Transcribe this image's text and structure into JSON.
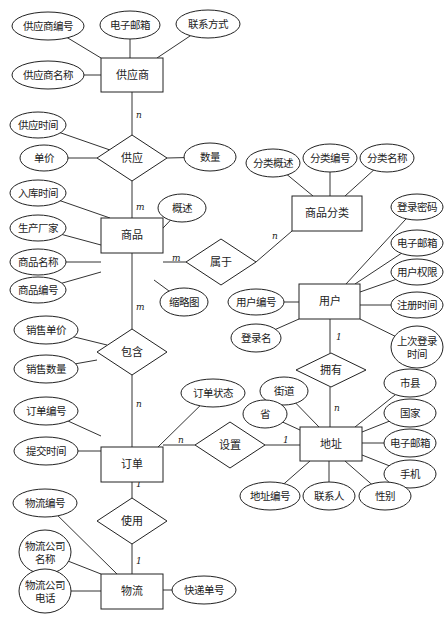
{
  "diagram": {
    "type": "ER diagram",
    "entities": [
      {
        "id": "supplier",
        "label": "供应商",
        "x": 101,
        "y": 58,
        "w": 62,
        "h": 34
      },
      {
        "id": "product",
        "label": "商品",
        "x": 101,
        "y": 218,
        "w": 62,
        "h": 35
      },
      {
        "id": "category",
        "label": "商品分类",
        "x": 292,
        "y": 196,
        "w": 70,
        "h": 35
      },
      {
        "id": "user",
        "label": "用户",
        "x": 299,
        "y": 284,
        "w": 61,
        "h": 35
      },
      {
        "id": "order",
        "label": "订单",
        "x": 101,
        "y": 447,
        "w": 62,
        "h": 35
      },
      {
        "id": "address",
        "label": "地址",
        "x": 300,
        "y": 427,
        "w": 62,
        "h": 34
      },
      {
        "id": "logistics",
        "label": "物流",
        "x": 101,
        "y": 574,
        "w": 62,
        "h": 35
      }
    ],
    "relationships": [
      {
        "id": "supply",
        "label": "供应",
        "cx": 132,
        "cy": 158,
        "hw": 35,
        "hh": 23
      },
      {
        "id": "belongs",
        "label": "属于",
        "cx": 221,
        "cy": 262,
        "hw": 35,
        "hh": 23
      },
      {
        "id": "contain",
        "label": "包含",
        "cx": 132,
        "cy": 352,
        "hw": 35,
        "hh": 23
      },
      {
        "id": "own",
        "label": "拥有",
        "cx": 331,
        "cy": 370,
        "hw": 35,
        "hh": 17
      },
      {
        "id": "setup",
        "label": "设置",
        "cx": 230,
        "cy": 445,
        "hw": 35,
        "hh": 23
      },
      {
        "id": "use",
        "label": "使用",
        "cx": 132,
        "cy": 521,
        "hw": 35,
        "hh": 23
      }
    ],
    "attributes": [
      {
        "label": "供应商编号",
        "cx": 48,
        "cy": 26,
        "rx": 36,
        "ry": 14,
        "to": [
          101,
          58
        ]
      },
      {
        "label": "电子邮箱",
        "cx": 130,
        "cy": 25,
        "rx": 30,
        "ry": 14,
        "to": [
          130,
          58
        ]
      },
      {
        "label": "联系方式",
        "cx": 208,
        "cy": 24,
        "rx": 32,
        "ry": 14,
        "to": [
          157,
          58
        ]
      },
      {
        "label": "供应商名称",
        "cx": 48,
        "cy": 75,
        "rx": 36,
        "ry": 14,
        "to": [
          101,
          75
        ]
      },
      {
        "label": "供应时间",
        "cx": 38,
        "cy": 125,
        "rx": 28,
        "ry": 13,
        "to": [
          110,
          150
        ]
      },
      {
        "label": "单价",
        "cx": 44,
        "cy": 158,
        "rx": 24,
        "ry": 13,
        "to": [
          97,
          158
        ]
      },
      {
        "label": "数量",
        "cx": 210,
        "cy": 157,
        "rx": 26,
        "ry": 14,
        "to": [
          167,
          158
        ]
      },
      {
        "label": "入库时间",
        "cx": 38,
        "cy": 193,
        "rx": 28,
        "ry": 13,
        "to": [
          110,
          218
        ]
      },
      {
        "label": "概述",
        "cx": 182,
        "cy": 208,
        "rx": 24,
        "ry": 14,
        "to": [
          147,
          245
        ]
      },
      {
        "label": "生产厂家",
        "cx": 38,
        "cy": 228,
        "rx": 28,
        "ry": 13,
        "to": [
          101,
          245
        ]
      },
      {
        "label": "商品名称",
        "cx": 38,
        "cy": 262,
        "rx": 28,
        "ry": 13,
        "to": [
          101,
          262
        ]
      },
      {
        "label": "商品编号",
        "cx": 38,
        "cy": 290,
        "rx": 28,
        "ry": 13,
        "to": [
          101,
          272
        ]
      },
      {
        "label": "缩略图",
        "cx": 184,
        "cy": 302,
        "rx": 24,
        "ry": 14,
        "to": [
          154,
          280
        ]
      },
      {
        "label": "分类概述",
        "cx": 273,
        "cy": 163,
        "rx": 27,
        "ry": 14,
        "to": [
          313,
          196
        ]
      },
      {
        "label": "分类编号",
        "cx": 330,
        "cy": 158,
        "rx": 27,
        "ry": 14,
        "to": [
          330,
          196
        ]
      },
      {
        "label": "分类名称",
        "cx": 387,
        "cy": 158,
        "rx": 27,
        "ry": 14,
        "to": [
          345,
          196
        ]
      },
      {
        "label": "登录密码",
        "cx": 417,
        "cy": 207,
        "rx": 26,
        "ry": 13,
        "to": [
          346,
          284
        ]
      },
      {
        "label": "电子邮箱",
        "cx": 417,
        "cy": 243,
        "rx": 26,
        "ry": 13,
        "to": [
          355,
          284
        ]
      },
      {
        "label": "用户权限",
        "cx": 417,
        "cy": 272,
        "rx": 26,
        "ry": 13,
        "to": [
          360,
          292
        ]
      },
      {
        "label": "用户编号",
        "cx": 256,
        "cy": 302,
        "rx": 28,
        "ry": 13,
        "to": [
          299,
          302
        ]
      },
      {
        "label": "注册时间",
        "cx": 417,
        "cy": 305,
        "rx": 26,
        "ry": 13,
        "to": [
          360,
          305
        ]
      },
      {
        "label": "登录名",
        "cx": 256,
        "cy": 338,
        "rx": 25,
        "ry": 14,
        "to": [
          299,
          319
        ]
      },
      {
        "label": "上次登录\n时间",
        "cx": 417,
        "cy": 347,
        "rx": 26,
        "ry": 21,
        "to": [
          360,
          319
        ]
      },
      {
        "label": "销售单价",
        "cx": 46,
        "cy": 330,
        "rx": 32,
        "ry": 14,
        "to": [
          107,
          345
        ]
      },
      {
        "label": "销售数量",
        "cx": 46,
        "cy": 369,
        "rx": 32,
        "ry": 14,
        "to": [
          97,
          360
        ]
      },
      {
        "label": "订单状态",
        "cx": 213,
        "cy": 393,
        "rx": 32,
        "ry": 14,
        "to": [
          158,
          447
        ]
      },
      {
        "label": "街道",
        "cx": 284,
        "cy": 391,
        "rx": 24,
        "ry": 14,
        "to": [
          319,
          427
        ]
      },
      {
        "label": "市县",
        "cx": 410,
        "cy": 383,
        "rx": 26,
        "ry": 14,
        "to": [
          355,
          427
        ]
      },
      {
        "label": "省",
        "cx": 265,
        "cy": 414,
        "rx": 22,
        "ry": 14,
        "to": [
          300,
          430
        ]
      },
      {
        "label": "订单编号",
        "cx": 46,
        "cy": 411,
        "rx": 32,
        "ry": 14,
        "to": [
          101,
          436
        ]
      },
      {
        "label": "国家",
        "cx": 410,
        "cy": 413,
        "rx": 26,
        "ry": 14,
        "to": [
          362,
          432
        ]
      },
      {
        "label": "电子邮箱",
        "cx": 410,
        "cy": 443,
        "rx": 26,
        "ry": 14,
        "to": [
          362,
          443
        ]
      },
      {
        "label": "提交时间",
        "cx": 46,
        "cy": 451,
        "rx": 32,
        "ry": 14,
        "to": [
          101,
          451
        ]
      },
      {
        "label": "手机",
        "cx": 410,
        "cy": 474,
        "rx": 26,
        "ry": 14,
        "to": [
          362,
          455
        ]
      },
      {
        "label": "地址编号",
        "cx": 270,
        "cy": 496,
        "rx": 30,
        "ry": 14,
        "to": [
          310,
          461
        ]
      },
      {
        "label": "联系人",
        "cx": 329,
        "cy": 496,
        "rx": 26,
        "ry": 14,
        "to": [
          329,
          461
        ]
      },
      {
        "label": "性别",
        "cx": 385,
        "cy": 496,
        "rx": 26,
        "ry": 14,
        "to": [
          345,
          461
        ]
      },
      {
        "label": "物流编号",
        "cx": 45,
        "cy": 503,
        "rx": 32,
        "ry": 14,
        "to": [
          117,
          574
        ]
      },
      {
        "label": "物流公司\n名称",
        "cx": 45,
        "cy": 552,
        "rx": 26,
        "ry": 22,
        "to": [
          101,
          574
        ]
      },
      {
        "label": "物流公司\n电话",
        "cx": 45,
        "cy": 591,
        "rx": 26,
        "ry": 22,
        "to": [
          101,
          591
        ]
      },
      {
        "label": "快递单号",
        "cx": 204,
        "cy": 590,
        "rx": 32,
        "ry": 14,
        "to": [
          163,
          590
        ]
      }
    ],
    "links": [
      {
        "from": [
          132,
          92
        ],
        "to": [
          132,
          135
        ],
        "card": "n",
        "cx": 136,
        "cy": 115
      },
      {
        "from": [
          132,
          181
        ],
        "to": [
          132,
          218
        ],
        "card": "m",
        "cx": 136,
        "cy": 207
      },
      {
        "from": [
          163,
          262
        ],
        "to": [
          186,
          262
        ],
        "card": "m",
        "cx": 172,
        "cy": 258
      },
      {
        "from": [
          256,
          262
        ],
        "to": [
          292,
          231
        ],
        "card": "n",
        "cx": 272,
        "cy": 236
      },
      {
        "from": [
          132,
          253
        ],
        "to": [
          132,
          329
        ],
        "card": "m",
        "cx": 136,
        "cy": 307
      },
      {
        "from": [
          132,
          375
        ],
        "to": [
          132,
          447
        ],
        "card": "n",
        "cx": 136,
        "cy": 404
      },
      {
        "from": [
          330,
          319
        ],
        "to": [
          330,
          353
        ],
        "card": "1",
        "cx": 336,
        "cy": 337
      },
      {
        "from": [
          330,
          387
        ],
        "to": [
          330,
          427
        ],
        "card": "n",
        "cx": 334,
        "cy": 408
      },
      {
        "from": [
          163,
          445
        ],
        "to": [
          195,
          445
        ],
        "card": "n",
        "cx": 178,
        "cy": 440
      },
      {
        "from": [
          265,
          445
        ],
        "to": [
          300,
          445
        ],
        "card": "1",
        "cx": 283,
        "cy": 440
      },
      {
        "from": [
          132,
          482
        ],
        "to": [
          132,
          498
        ],
        "card": "1",
        "cx": 136,
        "cy": 484
      },
      {
        "from": [
          132,
          544
        ],
        "to": [
          132,
          574
        ],
        "card": "1",
        "cx": 136,
        "cy": 561
      }
    ]
  }
}
